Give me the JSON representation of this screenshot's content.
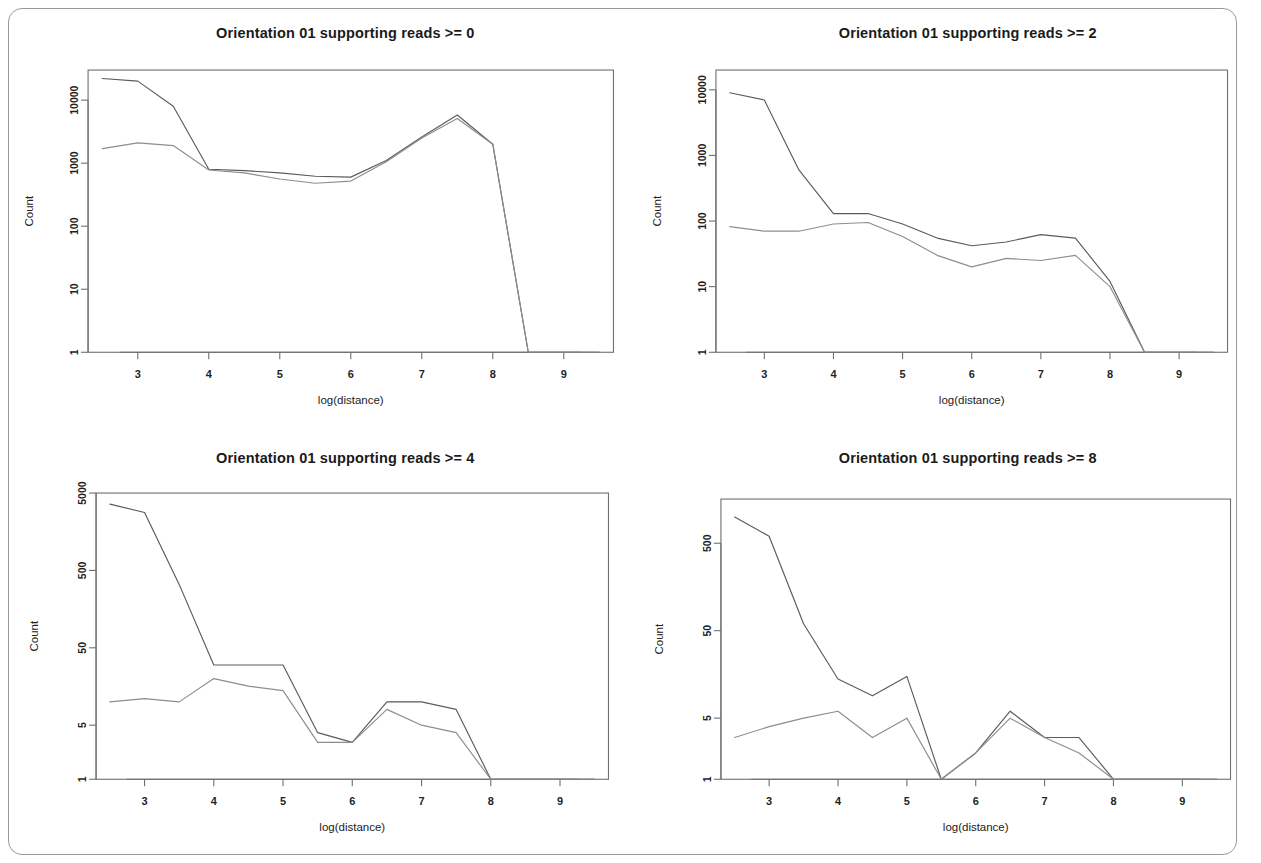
{
  "figure": {
    "frame_border_color": "#9a9a9a",
    "background": "#ffffff",
    "panel_count": 4
  },
  "chart_data": [
    {
      "id": "panel-top-left",
      "type": "line",
      "title": "Orientation 01 supporting reads >= 0",
      "xlabel": "log(distance)",
      "ylabel": "Count",
      "yscale": "log",
      "grid": false,
      "legend": "none",
      "xlim": [
        2.3,
        9.7
      ],
      "ylim": [
        1,
        30000
      ],
      "xticks": [
        3,
        4,
        5,
        6,
        7,
        8,
        9
      ],
      "xticklabels": [
        "3",
        "4",
        "5",
        "6",
        "7",
        "8",
        "9"
      ],
      "yticks": [
        1,
        10,
        100,
        1000,
        10000
      ],
      "yticklabels": [
        "1",
        "10",
        "100",
        "1000",
        "10000"
      ],
      "x": [
        2.5,
        3.0,
        3.5,
        4.0,
        4.5,
        5.0,
        5.5,
        6.0,
        6.5,
        7.0,
        7.5,
        8.0,
        8.5,
        9.0,
        9.5
      ],
      "series": [
        {
          "name": "series-1",
          "color": "#5b5b5b",
          "values": [
            22000,
            20000,
            8000,
            800,
            760,
            700,
            620,
            600,
            1100,
            2600,
            5800,
            2000,
            1,
            1,
            1
          ]
        },
        {
          "name": "series-2",
          "color": "#8d8d8d",
          "values": [
            1700,
            2100,
            1900,
            780,
            700,
            560,
            480,
            520,
            1050,
            2500,
            5100,
            2000,
            1,
            1,
            1
          ]
        }
      ]
    },
    {
      "id": "panel-top-right",
      "type": "line",
      "title": "Orientation 01 supporting reads >= 2",
      "xlabel": "log(distance)",
      "ylabel": "Count",
      "yscale": "log",
      "grid": false,
      "legend": "none",
      "xlim": [
        2.3,
        9.7
      ],
      "ylim": [
        1,
        20000
      ],
      "xticks": [
        3,
        4,
        5,
        6,
        7,
        8,
        9
      ],
      "xticklabels": [
        "3",
        "4",
        "5",
        "6",
        "7",
        "8",
        "9"
      ],
      "yticks": [
        1,
        10,
        100,
        1000,
        10000
      ],
      "yticklabels": [
        "1",
        "10",
        "100",
        "1000",
        "10000"
      ],
      "x": [
        2.5,
        3.0,
        3.5,
        4.0,
        4.5,
        5.0,
        5.5,
        6.0,
        6.5,
        7.0,
        7.5,
        8.0,
        8.5,
        9.0,
        9.5
      ],
      "series": [
        {
          "name": "series-1",
          "color": "#5b5b5b",
          "values": [
            9000,
            7000,
            600,
            130,
            130,
            90,
            55,
            42,
            48,
            62,
            55,
            12,
            1,
            1,
            1
          ]
        },
        {
          "name": "series-2",
          "color": "#8d8d8d",
          "values": [
            82,
            70,
            70,
            90,
            95,
            58,
            30,
            20,
            27,
            25,
            30,
            10,
            1,
            1,
            1
          ]
        }
      ]
    },
    {
      "id": "panel-bottom-left",
      "type": "line",
      "title": "Orientation 01 supporting reads >= 4",
      "xlabel": "log(distance)",
      "ylabel": "Count",
      "yscale": "log",
      "grid": false,
      "legend": "none",
      "xlim": [
        2.3,
        9.7
      ],
      "ylim": [
        1,
        5000
      ],
      "xticks": [
        3,
        4,
        5,
        6,
        7,
        8,
        9
      ],
      "xticklabels": [
        "3",
        "4",
        "5",
        "6",
        "7",
        "8",
        "9"
      ],
      "yticks": [
        1,
        5,
        50,
        500,
        5000
      ],
      "yticklabels": [
        "1",
        "5",
        "50",
        "500",
        "5000"
      ],
      "x": [
        2.5,
        3.0,
        3.5,
        4.0,
        4.5,
        5.0,
        5.5,
        6.0,
        6.5,
        7.0,
        7.5,
        8.0,
        8.5,
        9.0,
        9.5
      ],
      "series": [
        {
          "name": "series-1",
          "color": "#5b5b5b",
          "values": [
            3600,
            2800,
            330,
            30,
            30,
            30,
            4,
            3,
            10,
            10,
            8,
            1,
            1,
            1,
            1
          ]
        },
        {
          "name": "series-2",
          "color": "#8d8d8d",
          "values": [
            10,
            11,
            10,
            20,
            16,
            14,
            3,
            3,
            8,
            5,
            4,
            1,
            1,
            1,
            1
          ]
        }
      ]
    },
    {
      "id": "panel-bottom-right",
      "type": "line",
      "title": "Orientation 01 supporting reads >= 8",
      "xlabel": "log(distance)",
      "ylabel": "Count",
      "yscale": "log",
      "grid": false,
      "legend": "none",
      "xlim": [
        2.3,
        9.7
      ],
      "ylim": [
        1,
        1600
      ],
      "xticks": [
        3,
        4,
        5,
        6,
        7,
        8,
        9
      ],
      "xticklabels": [
        "3",
        "4",
        "5",
        "6",
        "7",
        "8",
        "9"
      ],
      "yticks": [
        1,
        5,
        50,
        500
      ],
      "yticklabels": [
        "1",
        "5",
        "50",
        "500"
      ],
      "x": [
        2.5,
        3.0,
        3.5,
        4.0,
        4.5,
        5.0,
        5.5,
        6.0,
        6.5,
        7.0,
        7.5,
        8.0,
        8.5,
        9.0,
        9.5
      ],
      "series": [
        {
          "name": "series-1",
          "color": "#5b5b5b",
          "values": [
            1000,
            600,
            60,
            14,
            9,
            15,
            1,
            2,
            6,
            3,
            3,
            1,
            1,
            1,
            1
          ]
        },
        {
          "name": "series-2",
          "color": "#8d8d8d",
          "values": [
            3,
            4,
            5,
            6,
            3,
            5,
            1,
            2,
            5,
            3,
            2,
            1,
            1,
            1,
            1
          ]
        }
      ]
    }
  ]
}
